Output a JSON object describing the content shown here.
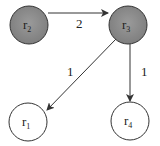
{
  "diagram": {
    "type": "directed-graph",
    "colors": {
      "shaded_fill": "#8a8a8a",
      "plain_fill": "#ffffff",
      "stroke": "#333333"
    },
    "nodes": [
      {
        "id": "r2",
        "label": "r",
        "subscript": "2",
        "shaded": true,
        "cx": 29,
        "cy": 25
      },
      {
        "id": "r3",
        "label": "r",
        "subscript": "3",
        "shaded": true,
        "cx": 128,
        "cy": 25
      },
      {
        "id": "r1",
        "label": "r",
        "subscript": "1",
        "shaded": false,
        "cx": 28,
        "cy": 122
      },
      {
        "id": "r4",
        "label": "r",
        "subscript": "4",
        "shaded": false,
        "cx": 130,
        "cy": 121
      }
    ],
    "edges": [
      {
        "from": "r2",
        "to": "r3",
        "weight": "2"
      },
      {
        "from": "r3",
        "to": "r1",
        "weight": "1"
      },
      {
        "from": "r3",
        "to": "r4",
        "weight": "1"
      }
    ]
  }
}
